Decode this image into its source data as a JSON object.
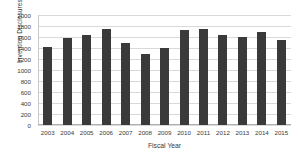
{
  "chart_data": {
    "type": "bar",
    "title": "",
    "xlabel": "Fiscal Year",
    "ylabel": "Invention Disclosures - NASA",
    "categories": [
      "2003",
      "2004",
      "2005",
      "2006",
      "2007",
      "2008",
      "2009",
      "2010",
      "2011",
      "2012",
      "2013",
      "2014",
      "2015"
    ],
    "values": [
      1425,
      1590,
      1640,
      1750,
      1490,
      1290,
      1400,
      1730,
      1740,
      1630,
      1600,
      1685,
      1540
    ],
    "ylim": [
      0,
      2000
    ],
    "ytick_values": [
      0,
      200,
      400,
      600,
      800,
      1000,
      1200,
      1400,
      1600,
      1800,
      2000
    ],
    "ytick_labels": [
      "0",
      "200",
      "400",
      "600",
      "800",
      "1000",
      "1200",
      "1400",
      "1600",
      "1800",
      "2000"
    ],
    "grid": true,
    "legend": false,
    "bar_color": "#3a3a3a",
    "grid_color": "#d9d9d9",
    "background_color": "#ffffff"
  }
}
